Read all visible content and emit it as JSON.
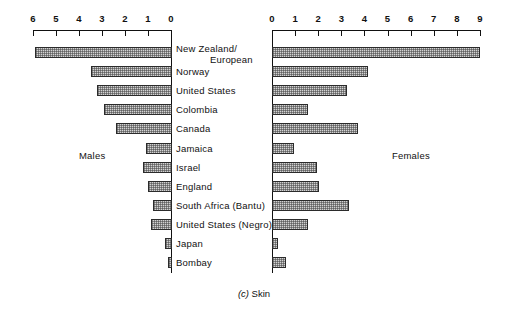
{
  "figure": {
    "caption_marker": "(c)",
    "caption_text": "Skin",
    "left_panel_label": "Males",
    "right_panel_label": "Females"
  },
  "chart_data": {
    "type": "bar",
    "orientation": "horizontal",
    "layout": "bidirectional population pyramid (back-to-back bars)",
    "xlabel": "",
    "ylabel": "",
    "grid": false,
    "legend": "none",
    "categories": [
      "New Zealand/ European",
      "Norway",
      "United States",
      "Colombia",
      "Canada",
      "Jamaica",
      "Israel",
      "England",
      "South Africa (Bantu)",
      "United States (Negro)",
      "Japan",
      "Bombay"
    ],
    "category_lines": [
      [
        "New Zealand/",
        "European"
      ],
      [
        "Norway"
      ],
      [
        "United States"
      ],
      [
        "Colombia"
      ],
      [
        "Canada"
      ],
      [
        "Jamaica"
      ],
      [
        "Israel"
      ],
      [
        "England"
      ],
      [
        "South Africa (Bantu)"
      ],
      [
        "United States (Negro)"
      ],
      [
        "Japan"
      ],
      [
        "Bombay"
      ]
    ],
    "series": [
      {
        "name": "Males",
        "side": "left",
        "axis_direction": "right-to-left",
        "xlim": [
          0,
          6
        ],
        "ticks": [
          6,
          5,
          4,
          3,
          2,
          1,
          0
        ],
        "tick_labels": [
          "6",
          "5",
          "4",
          "3",
          "2",
          "1",
          "0"
        ],
        "values": [
          5.9,
          3.5,
          3.2,
          2.9,
          2.4,
          1.1,
          1.2,
          1.0,
          0.8,
          0.85,
          0.25,
          0.15
        ]
      },
      {
        "name": "Females",
        "side": "right",
        "axis_direction": "left-to-right",
        "xlim": [
          0,
          9
        ],
        "ticks": [
          0,
          1,
          2,
          3,
          4,
          5,
          6,
          7,
          8,
          9
        ],
        "tick_labels": [
          "0",
          "1",
          "2",
          "3",
          "4",
          "5",
          "6",
          "7",
          "8",
          "9"
        ],
        "values": [
          8.95,
          4.1,
          3.2,
          1.5,
          3.7,
          0.9,
          1.9,
          2.0,
          3.3,
          1.5,
          0.2,
          0.55
        ]
      }
    ],
    "colors": {
      "bar_fill": "#d2d2d2",
      "bar_pattern": "#464646",
      "bar_border": "#2b2b2b",
      "axis": "#111111",
      "text": "#111111",
      "background": "#ffffff"
    }
  }
}
